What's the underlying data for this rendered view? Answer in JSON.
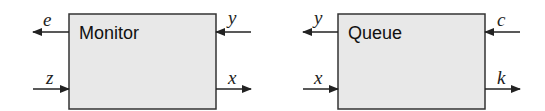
{
  "colors": {
    "box_fill": "#e8e8e8",
    "box_stroke": "#333333",
    "line": "#222222",
    "background": "#ffffff"
  },
  "blocks": [
    {
      "name": "Monitor",
      "ports": {
        "left_top": {
          "label": "e",
          "direction": "out"
        },
        "left_bottom": {
          "label": "z",
          "direction": "in"
        },
        "right_top": {
          "label": "y",
          "direction": "in"
        },
        "right_bottom": {
          "label": "x",
          "direction": "out"
        }
      }
    },
    {
      "name": "Queue",
      "ports": {
        "left_top": {
          "label": "y",
          "direction": "out"
        },
        "left_bottom": {
          "label": "x",
          "direction": "in"
        },
        "right_top": {
          "label": "c",
          "direction": "in"
        },
        "right_bottom": {
          "label": "k",
          "direction": "out"
        }
      }
    }
  ]
}
